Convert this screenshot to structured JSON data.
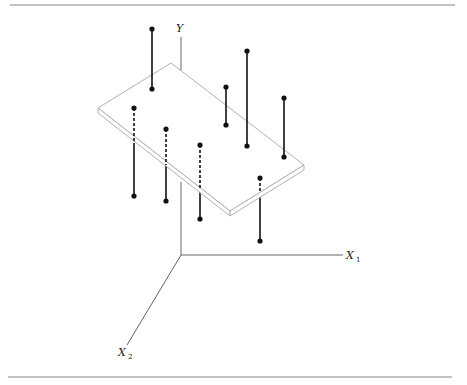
{
  "figure": {
    "axes": {
      "y_label": "Y",
      "x1_label": "X",
      "x1_sub": "1",
      "x2_label": "X",
      "x2_sub": "2"
    },
    "colors": {
      "plane": "#b0b0b0",
      "axis": "#666666",
      "stem": "#111111",
      "rule": "#888888"
    },
    "points": [
      {
        "id": 1,
        "position": "above",
        "hidden_part": "none"
      },
      {
        "id": 2,
        "position": "below",
        "hidden_part": "upper"
      },
      {
        "id": 3,
        "position": "below",
        "hidden_part": "upper"
      },
      {
        "id": 4,
        "position": "below",
        "hidden_part": "upper"
      },
      {
        "id": 5,
        "position": "below",
        "hidden_part": "upper"
      },
      {
        "id": 6,
        "position": "above",
        "hidden_part": "none"
      },
      {
        "id": 7,
        "position": "above",
        "hidden_part": "none"
      },
      {
        "id": 8,
        "position": "above",
        "hidden_part": "none"
      }
    ]
  }
}
